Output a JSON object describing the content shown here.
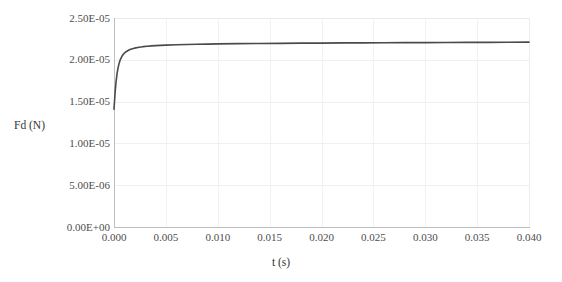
{
  "chart_data": {
    "type": "line",
    "title": "",
    "xlabel": "t (s)",
    "ylabel": "Fd (N)",
    "xlim": [
      0.0,
      0.04
    ],
    "ylim": [
      0.0,
      2.5e-05
    ],
    "grid": true,
    "legend": false,
    "x_ticks": [
      "0.000",
      "0.005",
      "0.010",
      "0.015",
      "0.020",
      "0.025",
      "0.030",
      "0.035",
      "0.040"
    ],
    "x_tick_values": [
      0.0,
      0.005,
      0.01,
      0.015,
      0.02,
      0.025,
      0.03,
      0.035,
      0.04
    ],
    "y_ticks": [
      "0.00E+00",
      "5.00E-06",
      "1.00E-05",
      "1.50E-05",
      "2.00E-05",
      "2.50E-05"
    ],
    "y_tick_values": [
      0.0,
      5e-06,
      1e-05,
      1.5e-05,
      2e-05,
      2.5e-05
    ],
    "line_color": "#4a4a4a",
    "series": [
      {
        "name": "Fd",
        "x": [
          0.0,
          0.0001,
          0.0002,
          0.0003,
          0.0004,
          0.0005,
          0.0006,
          0.0008,
          0.001,
          0.0012,
          0.0014,
          0.0016,
          0.0018,
          0.002,
          0.0024,
          0.0028,
          0.0032,
          0.0036,
          0.004,
          0.005,
          0.006,
          0.007,
          0.008,
          0.009,
          0.01,
          0.012,
          0.014,
          0.016,
          0.018,
          0.02,
          0.022,
          0.024,
          0.026,
          0.028,
          0.03,
          0.032,
          0.034,
          0.036,
          0.038,
          0.04
        ],
        "y": [
          1.41e-05,
          1.6e-05,
          1.74e-05,
          1.84e-05,
          1.91e-05,
          1.96e-05,
          2e-05,
          2.05e-05,
          2.08e-05,
          2.1e-05,
          2.115e-05,
          2.125e-05,
          2.133e-05,
          2.14e-05,
          2.15e-05,
          2.157e-05,
          2.162e-05,
          2.166e-05,
          2.169e-05,
          2.176e-05,
          2.18e-05,
          2.183e-05,
          2.186e-05,
          2.188e-05,
          2.19e-05,
          2.193e-05,
          2.195e-05,
          2.197e-05,
          2.199e-05,
          2.2e-05,
          2.202e-05,
          2.203e-05,
          2.204e-05,
          2.205e-05,
          2.206e-05,
          2.207e-05,
          2.208e-05,
          2.209e-05,
          2.21e-05,
          2.211e-05
        ]
      }
    ]
  }
}
